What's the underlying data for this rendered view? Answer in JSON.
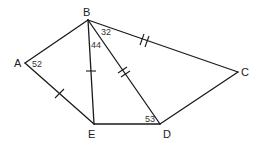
{
  "diagram": {
    "type": "geometry-figure",
    "vertices": {
      "A": {
        "label": "A"
      },
      "B": {
        "label": "B"
      },
      "C": {
        "label": "C"
      },
      "D": {
        "label": "D"
      },
      "E": {
        "label": "E"
      }
    },
    "segments": [
      "AB",
      "BC",
      "CD",
      "DE",
      "EA",
      "BE",
      "BD"
    ],
    "angles": {
      "A": {
        "value": "52",
        "vertex": "A"
      },
      "EBD": {
        "value": "44",
        "vertex": "B",
        "between": [
          "BE",
          "BD"
        ]
      },
      "DBC": {
        "value": "32",
        "vertex": "B",
        "between": [
          "BD",
          "BC"
        ]
      },
      "EDB": {
        "value": "53",
        "vertex": "D",
        "between": [
          "DE",
          "DB"
        ]
      }
    },
    "congruence_marks": {
      "single_tick": [
        "AE",
        "BE"
      ],
      "double_tick": [
        "BC",
        "BD"
      ]
    },
    "stroke_color": "#1a1a1a",
    "background": "#ffffff"
  }
}
